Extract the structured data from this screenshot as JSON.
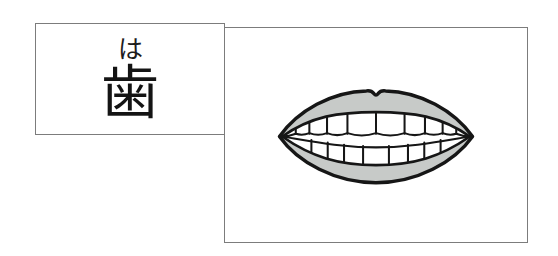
{
  "page": {
    "background_color": "#ffffff",
    "card_border_color": "#7c7c7c"
  },
  "flashcard": {
    "reading_kana": "は",
    "kanji": "歯",
    "meaning_hint": "tooth"
  },
  "picture_panel": {
    "illustration": "mouth-with-teeth-illustration",
    "lip_fill_color": "#c7cac8",
    "outline_color": "#161616",
    "teeth_fill_color": "#ffffff"
  }
}
